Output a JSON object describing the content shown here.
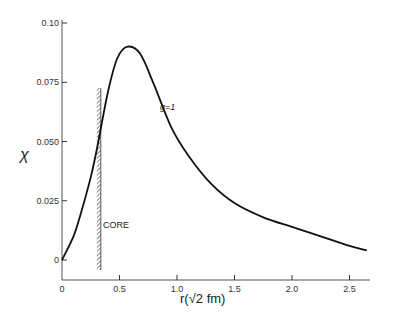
{
  "chart_data": {
    "type": "line",
    "title": "",
    "xlabel": "r(√2 fm)",
    "ylabel": "χ",
    "xlim": [
      0,
      2.7
    ],
    "ylim": [
      0,
      0.1
    ],
    "grid": false,
    "legend": null,
    "x_ticks": [
      "0",
      "0.5",
      "1.0",
      "1.5",
      "2.0",
      "2.5"
    ],
    "x_tick_values": [
      0,
      0.5,
      1.0,
      1.5,
      2.0,
      2.5
    ],
    "y_ticks": [
      "0",
      "0.025",
      "0.050",
      "0.075",
      "0.10"
    ],
    "y_tick_values": [
      0,
      0.025,
      0.05,
      0.075,
      0.1
    ],
    "series": [
      {
        "name": "g=1",
        "x": [
          0,
          0.1,
          0.16,
          0.25,
          0.3,
          0.4,
          0.48,
          0.57,
          0.68,
          0.8,
          0.95,
          1.1,
          1.3,
          1.5,
          1.75,
          2.0,
          2.25,
          2.5,
          2.65
        ],
        "values": [
          0,
          0.01,
          0.019,
          0.035,
          0.046,
          0.071,
          0.085,
          0.09,
          0.087,
          0.074,
          0.056,
          0.044,
          0.032,
          0.024,
          0.018,
          0.014,
          0.01,
          0.006,
          0.004
        ]
      }
    ],
    "annotations": [
      {
        "text": "g=1",
        "x": 0.82,
        "y": 0.067
      },
      {
        "text": "CORE",
        "x": 0.35,
        "y": 0.02,
        "note": "hatched vertical wall at r≈0.32"
      }
    ],
    "core_radius": 0.32
  },
  "labels": {
    "y_axis": "χ",
    "x_axis": "r(√2 fm)",
    "curve": "g=1",
    "core": "CORE"
  }
}
